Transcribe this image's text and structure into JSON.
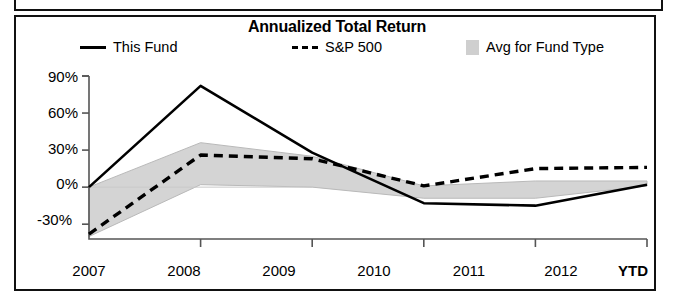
{
  "chart_data": {
    "type": "line",
    "title": "Annualized Total Return",
    "xlabel": "",
    "ylabel": "",
    "x": [
      "2007",
      "2008",
      "2009",
      "2010",
      "2011",
      "2012 YTD"
    ],
    "tick_labels_x": [
      "2007",
      "2008",
      "2009",
      "2010",
      "2011",
      "2012"
    ],
    "extra_x_label": "YTD",
    "tick_labels_y": [
      "90%",
      "60%",
      "30%",
      "0%",
      "-30%"
    ],
    "tick_values_y": [
      90,
      60,
      30,
      0,
      -30
    ],
    "ylim": [
      -42,
      90
    ],
    "grid": false,
    "legend_position": "top",
    "series": [
      {
        "name": "This Fund",
        "style": "solid",
        "color": "#000000",
        "values": [
          0,
          82,
          28,
          -13,
          -15,
          2
        ]
      },
      {
        "name": "S&P 500",
        "style": "dashed",
        "color": "#000000",
        "values": [
          -38,
          26,
          23,
          1,
          15,
          16
        ]
      },
      {
        "name": "Avg for Fund Type",
        "style": "band",
        "color": "#cccccc",
        "upper": [
          0,
          36,
          25,
          1,
          5,
          5
        ],
        "lower": [
          -40,
          2,
          0,
          -9,
          -9,
          1
        ]
      }
    ]
  },
  "legend": {
    "items": [
      {
        "label": "This Fund",
        "swatch": "solid-line-swatch"
      },
      {
        "label": "S&P 500",
        "swatch": "dashed-line-swatch"
      },
      {
        "label": "Avg for Fund Type",
        "swatch": "gray-box-swatch"
      }
    ]
  },
  "axis": {
    "y_labels": [
      "90%",
      "60%",
      "30%",
      "0%",
      "-30%"
    ],
    "x_labels": [
      "2007",
      "2008",
      "2009",
      "2010",
      "2011",
      "2012"
    ],
    "ytd_label": "YTD"
  },
  "colors": {
    "ink": "#000000",
    "band": "#cccccc",
    "frame": "#111111"
  }
}
